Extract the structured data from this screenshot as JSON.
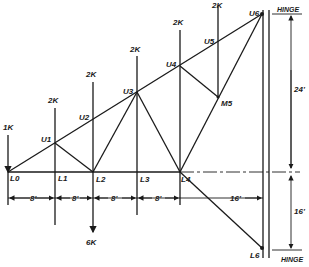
{
  "diagram": {
    "type": "truss",
    "loads": {
      "l0": "1K",
      "u1": "2K",
      "u2": "2K",
      "u3": "2K",
      "u4": "2K",
      "u5": "2K",
      "l2_down": "6K"
    },
    "nodes": {
      "L0": "L0",
      "L1": "L1",
      "L2": "L2",
      "L3": "L3",
      "L4": "L4",
      "L6": "L6",
      "U1": "U1",
      "U2": "U2",
      "U3": "U3",
      "U4": "U4",
      "U5": "U5",
      "U6": "U6",
      "M5": "M5"
    },
    "supports": {
      "top": "HINGE",
      "bottom": "HINGE"
    },
    "dimensions": {
      "panel1": "8'",
      "panel2": "8'",
      "panel3": "8'",
      "panel4": "8'",
      "last_span": "16'",
      "upper_height": "24'",
      "lower_height": "16'"
    }
  }
}
